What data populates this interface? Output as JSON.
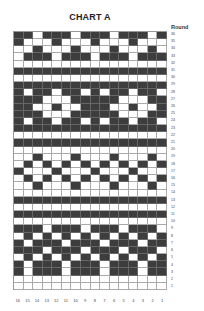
{
  "title": "CHART A",
  "round_label": "Round",
  "colors": {
    "dark": "#3d3d3d",
    "light": "#ffffff",
    "grid": "#aaaaaa"
  },
  "chart_data": {
    "type": "heatmap",
    "title": "CHART A",
    "xlabel": "",
    "ylabel": "Round",
    "x_tick_labels": [
      "16",
      "15",
      "14",
      "13",
      "12",
      "11",
      "10",
      "9",
      "8",
      "7",
      "6",
      "5",
      "4",
      "3",
      "2",
      "1"
    ],
    "y_tick_labels": [
      "36",
      "35",
      "34",
      "33",
      "32",
      "31",
      "30",
      "29",
      "28",
      "27",
      "26",
      "25",
      "24",
      "23",
      "22",
      "21",
      "20",
      "19",
      "18",
      "17",
      "16",
      "15",
      "14",
      "13",
      "12",
      "11",
      "10",
      "9",
      "8",
      "7",
      "6",
      "5",
      "4",
      "3",
      "2",
      "1"
    ],
    "legend": {
      "1": "dark / contrast color",
      "0": "light / main color"
    },
    "grid": true,
    "rows": [
      [
        1,
        1,
        0,
        1,
        1,
        1,
        0,
        1,
        1,
        1,
        0,
        1,
        1,
        1,
        0,
        1
      ],
      [
        1,
        0,
        0,
        0,
        1,
        0,
        0,
        0,
        1,
        0,
        0,
        0,
        1,
        0,
        0,
        0
      ],
      [
        0,
        0,
        1,
        0,
        0,
        0,
        1,
        0,
        0,
        0,
        1,
        0,
        0,
        0,
        1,
        0
      ],
      [
        0,
        1,
        1,
        1,
        0,
        1,
        1,
        1,
        0,
        1,
        1,
        1,
        0,
        1,
        1,
        1
      ],
      [
        0,
        0,
        0,
        0,
        0,
        0,
        0,
        0,
        0,
        0,
        0,
        0,
        0,
        0,
        0,
        0
      ],
      [
        1,
        1,
        1,
        1,
        1,
        1,
        1,
        1,
        1,
        1,
        1,
        1,
        1,
        1,
        1,
        1
      ],
      [
        0,
        0,
        0,
        0,
        0,
        0,
        0,
        0,
        0,
        0,
        0,
        0,
        0,
        0,
        0,
        0
      ],
      [
        1,
        1,
        1,
        1,
        1,
        1,
        1,
        1,
        1,
        1,
        1,
        1,
        1,
        1,
        1,
        1
      ],
      [
        1,
        0,
        1,
        1,
        0,
        1,
        1,
        0,
        1,
        0,
        1,
        1,
        0,
        1,
        1,
        0
      ],
      [
        1,
        1,
        1,
        0,
        0,
        0,
        1,
        1,
        1,
        1,
        1,
        0,
        0,
        0,
        1,
        1
      ],
      [
        1,
        1,
        0,
        0,
        1,
        0,
        0,
        1,
        1,
        1,
        0,
        0,
        1,
        0,
        0,
        1
      ],
      [
        1,
        1,
        1,
        0,
        0,
        0,
        1,
        1,
        1,
        1,
        1,
        0,
        0,
        0,
        1,
        1
      ],
      [
        1,
        0,
        1,
        1,
        0,
        1,
        1,
        0,
        1,
        0,
        1,
        1,
        0,
        1,
        1,
        0
      ],
      [
        1,
        1,
        1,
        1,
        1,
        1,
        1,
        1,
        1,
        1,
        1,
        1,
        1,
        1,
        1,
        1
      ],
      [
        0,
        0,
        0,
        0,
        0,
        0,
        0,
        0,
        0,
        0,
        0,
        0,
        0,
        0,
        0,
        0
      ],
      [
        1,
        1,
        1,
        1,
        1,
        1,
        1,
        1,
        1,
        1,
        1,
        1,
        1,
        1,
        1,
        1
      ],
      [
        0,
        0,
        0,
        0,
        0,
        0,
        0,
        0,
        0,
        0,
        0,
        0,
        0,
        0,
        0,
        0
      ],
      [
        0,
        0,
        1,
        0,
        0,
        0,
        1,
        0,
        0,
        0,
        1,
        0,
        0,
        0,
        1,
        0
      ],
      [
        0,
        1,
        0,
        1,
        0,
        1,
        0,
        1,
        0,
        1,
        0,
        1,
        0,
        1,
        0,
        1
      ],
      [
        1,
        0,
        0,
        0,
        1,
        0,
        0,
        0,
        1,
        0,
        0,
        0,
        1,
        0,
        0,
        0
      ],
      [
        0,
        1,
        0,
        1,
        0,
        1,
        0,
        1,
        0,
        1,
        0,
        1,
        0,
        1,
        0,
        1
      ],
      [
        0,
        0,
        1,
        0,
        0,
        0,
        1,
        0,
        0,
        0,
        1,
        0,
        0,
        0,
        1,
        0
      ],
      [
        0,
        0,
        0,
        0,
        0,
        0,
        0,
        0,
        0,
        0,
        0,
        0,
        0,
        0,
        0,
        0
      ],
      [
        1,
        1,
        1,
        1,
        1,
        1,
        1,
        1,
        1,
        1,
        1,
        1,
        1,
        1,
        1,
        1
      ],
      [
        0,
        0,
        0,
        0,
        0,
        0,
        0,
        0,
        0,
        0,
        0,
        0,
        0,
        0,
        0,
        0
      ],
      [
        1,
        1,
        1,
        1,
        1,
        1,
        1,
        1,
        1,
        1,
        1,
        1,
        1,
        1,
        1,
        1
      ],
      [
        0,
        0,
        0,
        0,
        0,
        0,
        0,
        0,
        0,
        0,
        0,
        0,
        0,
        0,
        0,
        0
      ],
      [
        1,
        1,
        1,
        0,
        1,
        1,
        1,
        0,
        1,
        1,
        1,
        0,
        1,
        1,
        1,
        0
      ],
      [
        0,
        1,
        0,
        1,
        0,
        1,
        0,
        1,
        0,
        1,
        0,
        1,
        0,
        1,
        0,
        1
      ],
      [
        1,
        0,
        1,
        1,
        1,
        0,
        1,
        1,
        1,
        0,
        1,
        1,
        1,
        0,
        1,
        1
      ],
      [
        1,
        1,
        1,
        0,
        1,
        1,
        1,
        0,
        1,
        1,
        1,
        0,
        1,
        1,
        1,
        0
      ],
      [
        0,
        1,
        0,
        1,
        0,
        1,
        0,
        1,
        0,
        1,
        0,
        1,
        0,
        1,
        0,
        1
      ],
      [
        1,
        0,
        1,
        1,
        1,
        0,
        1,
        1,
        1,
        0,
        1,
        1,
        1,
        0,
        1,
        1
      ],
      [
        1,
        0,
        1,
        1,
        1,
        0,
        1,
        1,
        1,
        0,
        1,
        1,
        1,
        0,
        1,
        1
      ],
      [
        0,
        0,
        0,
        0,
        0,
        0,
        0,
        0,
        0,
        0,
        0,
        0,
        0,
        0,
        0,
        0
      ],
      [
        0,
        0,
        0,
        0,
        0,
        0,
        0,
        0,
        0,
        0,
        0,
        0,
        0,
        0,
        0,
        0
      ]
    ]
  }
}
